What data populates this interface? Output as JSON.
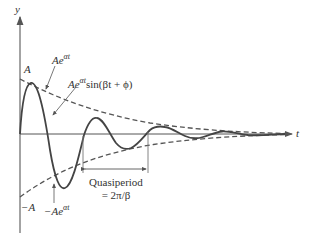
{
  "diagram": {
    "axes": {
      "y_label": "y",
      "t_label": "t"
    },
    "labels": {
      "amp_top": "A",
      "amp_bottom": "−A",
      "envelope_upper_base": "Ae",
      "envelope_upper_exp": "αt",
      "envelope_lower_base": "−Ae",
      "envelope_lower_exp": "αt",
      "curve_base": "Ae",
      "curve_exp": "αt",
      "curve_rest": "sin(βt + ϕ)",
      "quasiperiod_line1": "Quasiperiod",
      "quasiperiod_line2": "= 2π/β"
    },
    "colors": {
      "curve": "#444444",
      "envelope": "#555555",
      "axis": "#555555",
      "text": "#333333"
    }
  }
}
